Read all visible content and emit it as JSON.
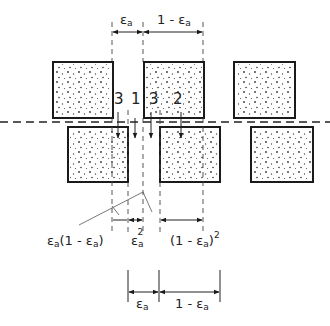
{
  "figure": {
    "top_dimension": {
      "left_label": "ε",
      "left_sub": "a",
      "right_label": "1 - ε",
      "right_sub": "a"
    },
    "channel_labels": {
      "left_3": "3",
      "center_1": "1",
      "center_3": "3",
      "right_2": "2"
    },
    "middle_dimension": {
      "label_a": "ε",
      "label_a_sub": "a",
      "label_a_tail": "(1 - ε",
      "label_a_tail_sub": "a",
      "label_a_close": ")",
      "label_b": "ε",
      "label_b_sub": "a",
      "label_b_sup": "2",
      "label_c_prefix": "(1 - ε",
      "label_c_sub": "a",
      "label_c_close": ")",
      "label_c_sup": "2"
    },
    "bottom_dimension": {
      "left_label": "ε",
      "left_sub": "a",
      "right_label": "1 - ε",
      "right_sub": "a"
    },
    "colors": {
      "line": "#1a1a1a",
      "background": "#ffffff"
    }
  }
}
